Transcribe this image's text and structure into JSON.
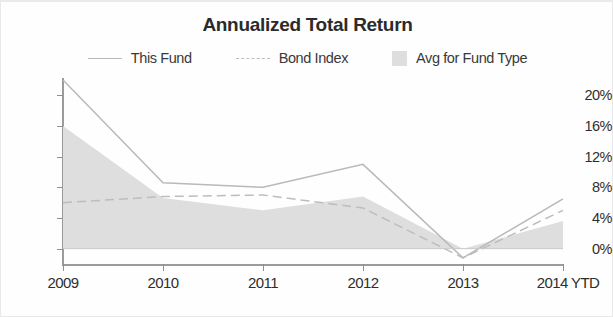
{
  "chart_data": {
    "type": "line",
    "title": "Annualized Total Return",
    "xlabel": "",
    "ylabel": "",
    "grid": false,
    "legend_position": "top-center",
    "categories": [
      "2009",
      "2010",
      "2011",
      "2012",
      "2013",
      "2014 YTD"
    ],
    "x_tick_labels": [
      "2009",
      "2010",
      "2011",
      "2012",
      "2013",
      "2014 YTD"
    ],
    "y_tick_labels": [
      "0%",
      "4%",
      "8%",
      "12%",
      "16%",
      "20%"
    ],
    "y_tick_values": [
      0,
      4,
      8,
      12,
      16,
      20
    ],
    "ylim": [
      -2,
      22
    ],
    "series": [
      {
        "name": "This Fund",
        "style": "solid-line",
        "color": "#b9b9b9",
        "values": [
          22.0,
          8.6,
          8.0,
          11.0,
          -1.2,
          6.5
        ]
      },
      {
        "name": "Bond Index",
        "style": "dashed-line",
        "color": "#bdbdbd",
        "values": [
          6.0,
          6.8,
          7.0,
          5.3,
          -1.2,
          5.0
        ]
      },
      {
        "name": "Avg for Fund Type",
        "style": "filled-area",
        "color": "#dedede",
        "values": [
          16.0,
          6.6,
          5.0,
          6.8,
          0.0,
          3.6
        ]
      }
    ]
  },
  "legend": {
    "items": [
      {
        "label": "This Fund",
        "key": "solid-line-key"
      },
      {
        "label": "Bond Index",
        "key": "dashed-line-key"
      },
      {
        "label": "Avg for Fund Type",
        "key": "gray-swatch-key"
      }
    ]
  }
}
